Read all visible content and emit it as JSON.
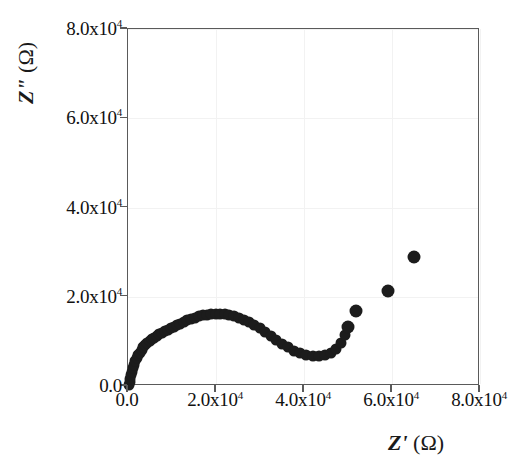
{
  "chart_data": {
    "type": "scatter",
    "title": "",
    "subtitle": "",
    "xlabel": "Z' (Ω)",
    "ylabel": "Z\" (Ω)",
    "xlabel_symbol": "Z'",
    "xlabel_unit": "(Ω)",
    "ylabel_symbol": "Z\"",
    "ylabel_unit": "(Ω)",
    "grid": false,
    "legend": "none",
    "xlim": [
      0,
      80000
    ],
    "ylim": [
      0,
      80000
    ],
    "xticks": [
      0,
      20000,
      40000,
      60000,
      80000
    ],
    "yticks": [
      0,
      20000,
      40000,
      60000,
      80000
    ],
    "xticklabels": [
      "0.0",
      "2.0x10",
      "4.0x10",
      "6.0x10",
      "8.0x10"
    ],
    "yticklabels": [
      "0.0",
      "2.0x10",
      "4.0x10",
      "6.0x10",
      "8.0x10"
    ],
    "tick_exponent": "4",
    "marker": "filled-circle",
    "marker_color": "#1c1c1c",
    "series": [
      {
        "name": "impedance",
        "x": [
          200,
          350,
          500,
          700,
          900,
          1150,
          1400,
          1700,
          2000,
          2350,
          2700,
          3100,
          3500,
          3950,
          4400,
          4900,
          5400,
          5950,
          6500,
          7100,
          7700,
          8350,
          9000,
          9700,
          10400,
          11150,
          11900,
          12700,
          13500,
          14350,
          15200,
          16100,
          17000,
          17950,
          18900,
          19900,
          20900,
          21950,
          23000,
          24100,
          25200,
          26350,
          27500,
          28700,
          29900,
          31150,
          32400,
          33700,
          35000,
          36350,
          37700,
          39100,
          40500,
          41950,
          43400,
          44800,
          46100,
          47300,
          48400,
          49300,
          50000,
          51800,
          59000,
          65000
        ],
        "y": [
          300,
          900,
          1600,
          2400,
          3200,
          4000,
          4800,
          5500,
          6200,
          6900,
          7500,
          8100,
          8650,
          9150,
          9600,
          10050,
          10450,
          10850,
          11200,
          11550,
          11900,
          12250,
          12600,
          12950,
          13300,
          13650,
          14000,
          14350,
          14700,
          15050,
          15350,
          15600,
          15800,
          15950,
          16050,
          16100,
          16100,
          16050,
          15900,
          15650,
          15300,
          14850,
          14300,
          13650,
          12900,
          12050,
          11150,
          10250,
          9400,
          8650,
          7950,
          7350,
          6900,
          6650,
          6650,
          6950,
          7500,
          8400,
          9700,
          11400,
          13300,
          16900,
          21400,
          28900
        ]
      }
    ]
  },
  "axis": {
    "frame_color": "#5a5a5a",
    "tick_color": "#5a5a5a",
    "background": "#ffffff"
  }
}
